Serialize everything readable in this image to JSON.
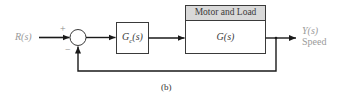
{
  "diagram": {
    "input": {
      "label": "R(s)"
    },
    "summing_junction": {
      "plus_sign": "+",
      "minus_sign": "−"
    },
    "controller": {
      "label": "Gc(s)",
      "symbol": "G",
      "subscript": "c",
      "arg": "(s)"
    },
    "plant": {
      "header": "Motor and Load",
      "label": "G(s)"
    },
    "output": {
      "label": "Y(s)",
      "description": "Speed"
    },
    "caption": "(b)",
    "colors": {
      "line": "#1a1a1a",
      "box_border": "#3a3a3a",
      "header_fill": "#d9d9d9",
      "io_text": "#9a9a9a"
    }
  }
}
